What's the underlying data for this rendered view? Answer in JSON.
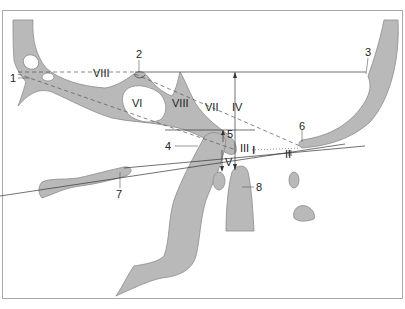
{
  "diagram": {
    "type": "anatomical-line-drawing",
    "colors": {
      "bone_fill": "#b9b9b9",
      "bone_stroke": "#8c8c8c",
      "line": "#333333",
      "frame": "#a9a9a9",
      "background": "#ffffff"
    },
    "structure_labels": [
      {
        "id": "1",
        "text": "1"
      },
      {
        "id": "2",
        "text": "2"
      },
      {
        "id": "3",
        "text": "3"
      },
      {
        "id": "4",
        "text": "4"
      },
      {
        "id": "5",
        "text": "5"
      },
      {
        "id": "6",
        "text": "6"
      },
      {
        "id": "7",
        "text": "7"
      },
      {
        "id": "8",
        "text": "8"
      }
    ],
    "line_labels": [
      {
        "id": "I",
        "text": "I"
      },
      {
        "id": "II",
        "text": "II"
      },
      {
        "id": "III",
        "text": "III"
      },
      {
        "id": "IV",
        "text": "IV"
      },
      {
        "id": "V",
        "text": "V"
      },
      {
        "id": "VI",
        "text": "VI"
      },
      {
        "id": "VII",
        "text": "VII"
      },
      {
        "id": "VIII_top",
        "text": "VIII"
      },
      {
        "id": "VIII_mid",
        "text": "VIII"
      }
    ]
  }
}
